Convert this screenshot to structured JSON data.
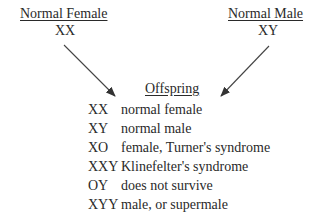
{
  "parents": {
    "female": {
      "label": "Normal Female",
      "genotype": "XX"
    },
    "male": {
      "label": "Normal Male",
      "genotype": "XY"
    }
  },
  "offspring": {
    "title": "Offspring",
    "rows": [
      {
        "genotype": "XX",
        "description": "normal female"
      },
      {
        "genotype": "XY",
        "description": "normal male"
      },
      {
        "genotype": "XO",
        "description": "female, Turner's syndrome"
      },
      {
        "genotype": "XXY",
        "description": "Klinefelter's syndrome"
      },
      {
        "genotype": "OY",
        "description": "does not survive"
      },
      {
        "genotype": "XYY",
        "description": "male, or supermale"
      }
    ]
  },
  "colors": {
    "text": "#2a2a2a",
    "arrow": "#333333",
    "background": "#ffffff"
  }
}
